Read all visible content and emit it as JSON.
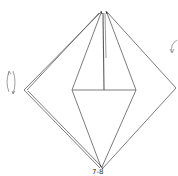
{
  "diagram": {
    "type": "origami-fold-diagram",
    "stroke_color": "#555555",
    "background": "#ffffff",
    "step_label": "7-8",
    "annotations": [
      {
        "name": "rotate-arrow-left",
        "description": "curved rotation arrows"
      },
      {
        "name": "fold-arrow-right",
        "description": "curved fold arrow"
      }
    ]
  }
}
